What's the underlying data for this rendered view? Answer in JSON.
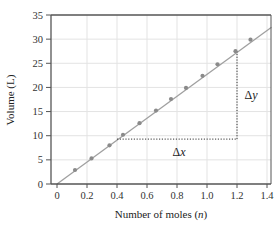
{
  "chart_data": {
    "type": "scatter",
    "title": "",
    "xlabel": "Number of moles (n)",
    "xlabel_parts": [
      "Number of moles (",
      "n",
      ")"
    ],
    "ylabel": "Volume (L)",
    "xlim": [
      -0.04,
      1.43
    ],
    "ylim": [
      0,
      35
    ],
    "xticks": [
      0,
      0.2,
      0.4,
      0.6,
      0.8,
      1.0,
      1.2,
      1.4
    ],
    "xtick_labels": [
      "0",
      "0.2",
      "0.4",
      "0.6",
      "0.8",
      "1.0",
      "1.2",
      "1.4"
    ],
    "yticks": [
      0,
      5,
      10,
      15,
      20,
      25,
      30,
      35
    ],
    "ytick_labels": [
      "0",
      "5",
      "10",
      "15",
      "20",
      "25",
      "30",
      "35"
    ],
    "grid": true,
    "legend": null,
    "series": [
      {
        "name": "Measured points",
        "x": [
          0.12,
          0.23,
          0.35,
          0.44,
          0.55,
          0.66,
          0.76,
          0.86,
          0.97,
          1.07,
          1.19,
          1.29
        ],
        "y": [
          2.9,
          5.3,
          8.0,
          10.2,
          12.6,
          15.2,
          17.6,
          19.9,
          22.4,
          24.8,
          27.5,
          29.9
        ]
      }
    ],
    "fit_line": {
      "slope": 22.7,
      "intercept": 0.0,
      "x_range": [
        0,
        1.43
      ]
    },
    "annotations": [
      {
        "text": "Δx",
        "type": "horizontal-dotted",
        "from": [
          0.4,
          9.3
        ],
        "to": [
          1.2,
          9.3
        ]
      },
      {
        "text": "Δy",
        "type": "vertical-dotted",
        "from": [
          1.2,
          9.3
        ],
        "to": [
          1.2,
          27.5
        ]
      }
    ],
    "colors": {
      "points": "#8a8a8a",
      "line": "#a0a0a0",
      "grid": "#e3e3e3",
      "axis": "#555555"
    }
  }
}
